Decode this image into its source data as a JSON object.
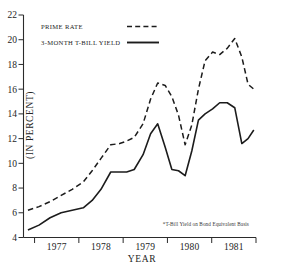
{
  "chart_data": {
    "type": "line",
    "title": "",
    "xlabel": "YEAR",
    "ylabel": "(IN PERCENT)",
    "xlim": [
      1976.75,
      1982.0
    ],
    "ylim": [
      4,
      22
    ],
    "yticks": [
      4,
      6,
      8,
      10,
      12,
      14,
      16,
      18,
      20,
      22
    ],
    "xticks": [
      1977,
      1978,
      1979,
      1980,
      1981
    ],
    "xtick_labels": [
      "1977",
      "1978",
      "1979",
      "1980",
      "1981"
    ],
    "grid": false,
    "legend_position": "top-left",
    "footnote": "*T-Bill Yield on Bond Equivalent Basis",
    "series": [
      {
        "name": "PRIME RATE",
        "style": "dashed",
        "color": "#1c1c1c",
        "x": [
          1976.85,
          1977.1,
          1977.35,
          1977.6,
          1977.85,
          1978.1,
          1978.3,
          1978.5,
          1978.72,
          1978.92,
          1979.08,
          1979.25,
          1979.45,
          1979.62,
          1979.78,
          1979.95,
          1980.1,
          1980.25,
          1980.4,
          1980.55,
          1980.7,
          1980.85,
          1981.02,
          1981.18,
          1981.35,
          1981.52,
          1981.68,
          1981.82,
          1981.95
        ],
        "y": [
          6.2,
          6.5,
          6.9,
          7.4,
          7.9,
          8.5,
          9.4,
          10.4,
          11.5,
          11.6,
          11.8,
          12.1,
          13.2,
          15.2,
          16.5,
          16.3,
          15.4,
          13.9,
          11.5,
          13.1,
          16.0,
          18.3,
          19.0,
          18.8,
          19.3,
          20.1,
          18.6,
          16.4,
          16.0
        ]
      },
      {
        "name": "3-MONTH T-BILL YIELD",
        "style": "solid",
        "color": "#1c1c1c",
        "x": [
          1976.85,
          1977.1,
          1977.35,
          1977.6,
          1977.85,
          1978.1,
          1978.3,
          1978.5,
          1978.72,
          1978.92,
          1979.08,
          1979.25,
          1979.45,
          1979.62,
          1979.78,
          1979.95,
          1980.1,
          1980.25,
          1980.4,
          1980.55,
          1980.7,
          1980.85,
          1981.02,
          1981.18,
          1981.35,
          1981.52,
          1981.68,
          1981.82,
          1981.95
        ],
        "y": [
          4.6,
          5.0,
          5.6,
          6.0,
          6.2,
          6.4,
          7.0,
          7.9,
          9.3,
          9.3,
          9.3,
          9.5,
          10.7,
          12.4,
          13.2,
          11.3,
          9.5,
          9.4,
          9.0,
          11.0,
          13.5,
          14.0,
          14.4,
          14.9,
          14.9,
          14.5,
          11.6,
          12.0,
          12.7
        ]
      }
    ]
  },
  "legend": {
    "items": [
      {
        "label": "PRIME RATE",
        "style": "dashed"
      },
      {
        "label": "3-MONTH T-BILL YIELD",
        "style": "solid"
      }
    ]
  },
  "axes": {
    "y_title": "(IN PERCENT)",
    "x_title": "YEAR"
  },
  "footnote": {
    "text": "*T-Bill Yield on Bond Equivalent Basis"
  }
}
